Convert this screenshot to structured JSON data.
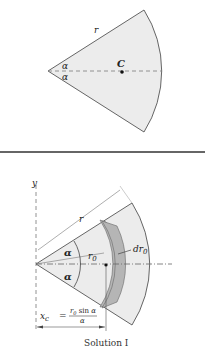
{
  "top_figure": {
    "radius_label": "r",
    "angle_label_upper": "α",
    "angle_label_lower": "α",
    "centroid_label": "C"
  },
  "bottom_figure": {
    "axis_label_y": "y",
    "radius_label": "r",
    "angle_label_upper": "α",
    "angle_label_lower": "α",
    "element_radius_label": "r0",
    "element_radius_sub": "0",
    "element_thickness_label": "dr0",
    "xc_label": "x",
    "xc_sub": "c",
    "xc_equals": "=",
    "xc_numerator": "r0 sin α",
    "xc_denominator": "α",
    "caption": "Solution I"
  },
  "colors": {
    "fill": "#ececec",
    "strip": "#b5b5b5",
    "stroke": "#555555"
  }
}
